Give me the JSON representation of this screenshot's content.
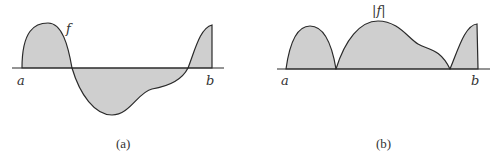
{
  "panel_a": {
    "curve_label": "f",
    "left_label": "a",
    "right_label": "b",
    "caption": "(a)"
  },
  "panel_b": {
    "curve_label": "|f|",
    "left_label": "a",
    "right_label": "b",
    "caption": "(b)"
  },
  "colors": {
    "fill": "#cfcfcf",
    "stroke": "#2a2a2a",
    "background": "#ffffff"
  }
}
